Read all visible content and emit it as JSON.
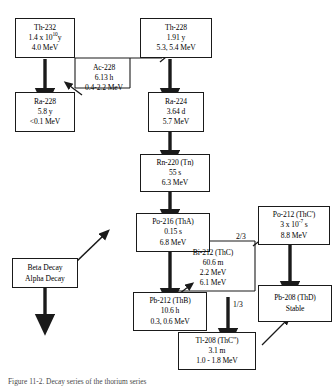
{
  "diagram": {
    "caption": "Figure 11-2. Decay series of the thorium series",
    "colors": {
      "line": "#1a1a1a",
      "box_border": "#1a1a1a",
      "background": "#ffffff",
      "text": "#000000"
    }
  },
  "nodes": {
    "th232": {
      "name": "Th-232",
      "halflife": "1.4 x 10",
      "halflife_exp": "10",
      "halflife_unit": "y",
      "energy": "4.0 MeV"
    },
    "th228": {
      "name": "Th-228",
      "halflife": "1.91 y",
      "energy": "5.3, 5.4 MeV"
    },
    "ac228": {
      "name": "Ac-228",
      "halflife": "6.13 h",
      "energy": "0.4-2.2 MeV"
    },
    "ra228": {
      "name": "Ra-228",
      "halflife": "5.8 y",
      "energy": "<0.1 MeV"
    },
    "ra224": {
      "name": "Ra-224",
      "halflife": "3.64 d",
      "energy": "5.7 MeV"
    },
    "rn220": {
      "name": "Rn-220 (Tn)",
      "halflife": "55 s",
      "energy": "6.3 MeV"
    },
    "po216": {
      "name": "Po-216 (ThA)",
      "halflife": "0.15 s",
      "energy": "6.8 MeV"
    },
    "po212": {
      "name": "Po-212 (ThC')",
      "halflife": "3 x 10",
      "halflife_exp": "-7",
      "halflife_unit": " s",
      "energy": "8.8 MeV"
    },
    "bi212": {
      "name": "Bi-212 (ThC)",
      "halflife": "60.6 m",
      "energy_beta": "2.2 MeV",
      "energy_alpha": "6.1 MeV"
    },
    "pb212": {
      "name": "Pb-212 (ThB)",
      "halflife": "10.6 h",
      "energy": "0.3, 0.6 MeV"
    },
    "pb208": {
      "name": "Pb-208 (ThD)",
      "status": "Stable"
    },
    "tl208": {
      "name": "Tl-208 (ThC\")",
      "halflife": "3.1 m",
      "energy": "1.0 - 1.8 MeV"
    }
  },
  "branches": {
    "to_po212": "2/3",
    "to_tl208": "1/3"
  },
  "legend": {
    "beta": "Beta Decay",
    "alpha": "Alpha Decay"
  }
}
